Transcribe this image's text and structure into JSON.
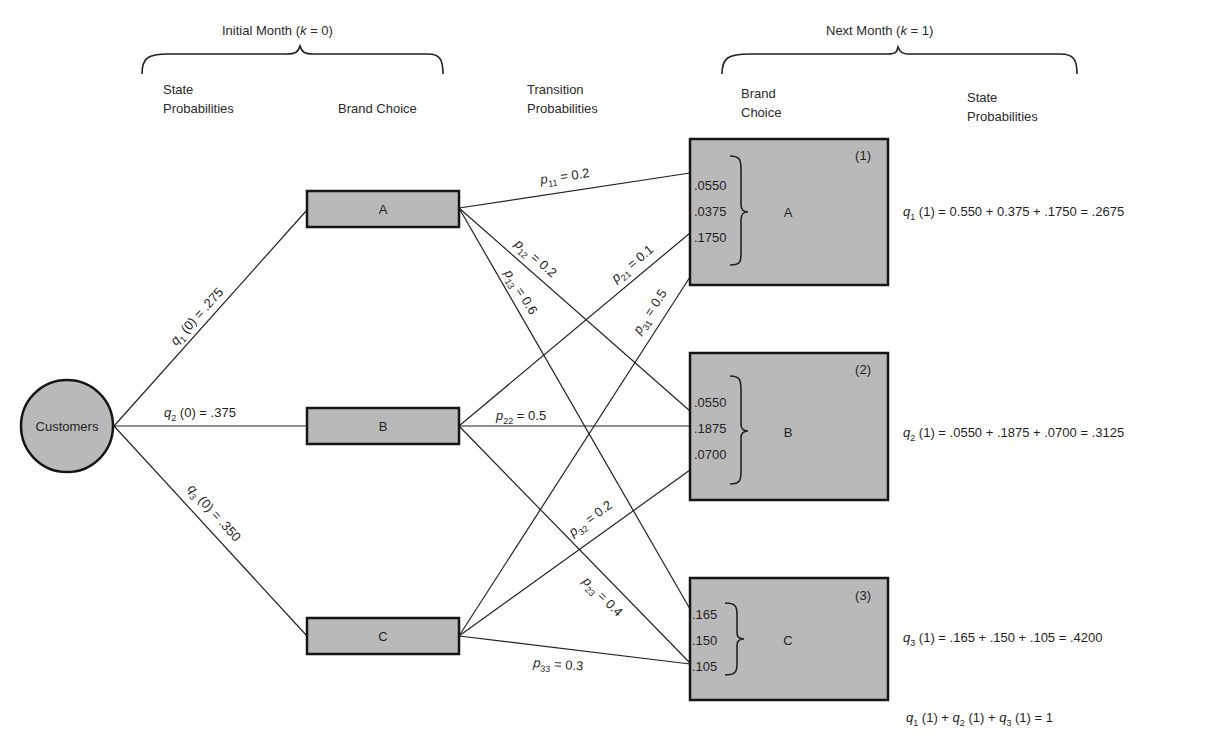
{
  "headers": {
    "initial_month": "Initial Month (k = 0)",
    "initial_month_prefix": "Initial Month (",
    "initial_month_k": "k",
    "initial_month_suffix": " = 0)",
    "next_month_prefix": "Next Month (",
    "next_month_k": "k",
    "next_month_suffix": " = 1)",
    "state_prob_line1": "State",
    "state_prob_line2": "Probabilities",
    "brand_choice": "Brand Choice",
    "transition_line1": "Transition",
    "transition_line2": "Probabilities",
    "brand_line1": "Brand",
    "brand_line2": "Choice"
  },
  "source_node": {
    "label": "Customers"
  },
  "initial_state_edges": [
    {
      "q": "q",
      "sub": "1",
      "rest": " (0) = .275",
      "value": 0.275
    },
    {
      "q": "q",
      "sub": "2",
      "rest": " (0) = .375",
      "value": 0.375
    },
    {
      "q": "q",
      "sub": "3",
      "rest": " (0) = .350",
      "value": 0.35
    }
  ],
  "brands_k0": [
    {
      "label": "A"
    },
    {
      "label": "B"
    },
    {
      "label": "C"
    }
  ],
  "transitions": [
    {
      "p": "p",
      "sub": "11",
      "rest": " = 0.2"
    },
    {
      "p": "p",
      "sub": "12",
      "rest": " = 0.2"
    },
    {
      "p": "p",
      "sub": "13",
      "rest": " = 0.6"
    },
    {
      "p": "p",
      "sub": "21",
      "rest": " = 0.1"
    },
    {
      "p": "p",
      "sub": "22",
      "rest": " = 0.5"
    },
    {
      "p": "p",
      "sub": "23",
      "rest": " = 0.4"
    },
    {
      "p": "p",
      "sub": "31",
      "rest": " = 0.5"
    },
    {
      "p": "p",
      "sub": "32",
      "rest": " = 0.2"
    },
    {
      "p": "p",
      "sub": "33",
      "rest": " = 0.3"
    }
  ],
  "brands_k1": [
    {
      "index": "(1)",
      "label": "A",
      "contributions": [
        ".0550",
        ".0375",
        ".1750"
      ]
    },
    {
      "index": "(2)",
      "label": "B",
      "contributions": [
        ".0550",
        ".1875",
        ".0700"
      ]
    },
    {
      "index": "(3)",
      "label": "C",
      "contributions": [
        ".165",
        ".150",
        ".105"
      ]
    }
  ],
  "state_probabilities_k1": [
    {
      "q": "q",
      "sub": "1",
      "rest": " (1) = 0.550 + 0.375 + .1750 = .2675"
    },
    {
      "q": "q",
      "sub": "2",
      "rest": " (1) = .0550 + .1875 + .0700 = .3125"
    },
    {
      "q": "q",
      "sub": "3",
      "rest": " (1) = .165 + .150 + .105 = .4200"
    }
  ],
  "sum_equation": {
    "parts": [
      {
        "q": "q",
        "sub": "1",
        "rest": " (1) + "
      },
      {
        "q": "q",
        "sub": "2",
        "rest": " (1) + "
      },
      {
        "q": "q",
        "sub": "3",
        "rest": " (1) = 1"
      }
    ]
  }
}
